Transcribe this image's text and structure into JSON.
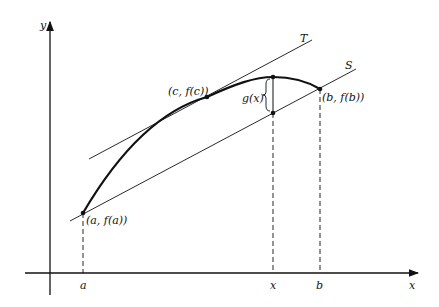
{
  "diagram": {
    "type": "mean-value-theorem-illustration",
    "axes": {
      "x_label": "x",
      "y_label": "y"
    },
    "x_ticks": [
      {
        "label": "a"
      },
      {
        "label": "x"
      },
      {
        "label": "b"
      }
    ],
    "points": {
      "a": "(a, f(a))",
      "c": "(c, f(c))",
      "b": "(b, f(b))"
    },
    "lines": {
      "tangent": "T",
      "secant": "S"
    },
    "gap_label": "g(x)",
    "colors": {
      "ink": "#111111",
      "background": "#ffffff"
    }
  }
}
